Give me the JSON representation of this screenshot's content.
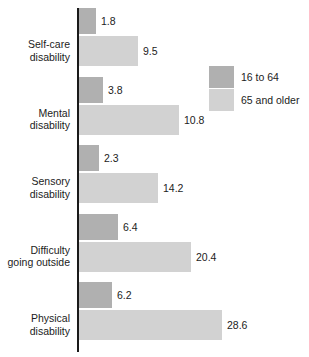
{
  "chart_data": {
    "type": "bar",
    "orientation": "horizontal",
    "title": "",
    "xlabel": "",
    "ylabel": "",
    "grid": false,
    "legend_position": "top-right",
    "categories": [
      "Self-care disability",
      "Mental disability",
      "Sensory disability",
      "Difficulty going outside",
      "Physical disability"
    ],
    "series": [
      {
        "name": "16 to 64",
        "color": "#b0b0b0",
        "values": [
          1.8,
          3.8,
          2.3,
          6.4,
          6.2
        ]
      },
      {
        "name": "65 and older",
        "color": "#d2d2d2",
        "values": [
          9.5,
          10.8,
          14.2,
          20.4,
          28.6
        ]
      }
    ],
    "xlim": [
      0,
      28.6
    ]
  },
  "groups": [
    {
      "label_line1": "Self-care",
      "label_line2": "disability",
      "bars": [
        {
          "series": "16 to 64",
          "value_label": "1.8",
          "pixel_length": 17
        },
        {
          "series": "65 and older",
          "value_label": "9.5",
          "pixel_length": 59
        }
      ]
    },
    {
      "label_line1": "Mental",
      "label_line2": "disability",
      "bars": [
        {
          "series": "16 to 64",
          "value_label": "3.8",
          "pixel_length": 24
        },
        {
          "series": "65 and older",
          "value_label": "10.8",
          "pixel_length": 100
        }
      ]
    },
    {
      "label_line1": "Sensory",
      "label_line2": "disability",
      "bars": [
        {
          "series": "16 to 64",
          "value_label": "2.3",
          "pixel_length": 20
        },
        {
          "series": "65 and older",
          "value_label": "14.2",
          "pixel_length": 79
        }
      ]
    },
    {
      "label_line1": "Difficulty",
      "label_line2": "going outside",
      "bars": [
        {
          "series": "16 to 64",
          "value_label": "6.4",
          "pixel_length": 39
        },
        {
          "series": "65 and older",
          "value_label": "20.4",
          "pixel_length": 112
        }
      ]
    },
    {
      "label_line1": "Physical",
      "label_line2": "disability",
      "bars": [
        {
          "series": "16 to 64",
          "value_label": "6.2",
          "pixel_length": 33
        },
        {
          "series": "65 and older",
          "value_label": "28.6",
          "pixel_length": 143
        }
      ]
    }
  ],
  "legend": {
    "items": [
      {
        "label": "16 to 64",
        "color": "#b0b0b0",
        "swatch": "legend-swatch-dark"
      },
      {
        "label": "65 and older",
        "color": "#d2d2d2",
        "swatch": "legend-swatch-light"
      }
    ]
  },
  "colors": {
    "series_16_to_64": "#b0b0b0",
    "series_65_and_older": "#d2d2d2",
    "axis": "#1a1a1a",
    "text": "#1c1c1c",
    "background": "#ffffff"
  }
}
